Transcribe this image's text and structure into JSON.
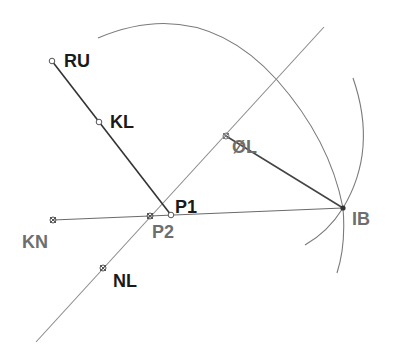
{
  "diagram": {
    "title": "",
    "colors": {
      "background": "#ffffff",
      "dark_line": "#333333",
      "light_line": "#8a8a8a",
      "arc": "#7a7a7a",
      "label_dark": "#1a1a1a",
      "label_gray": "#6e6e6e"
    },
    "points": [
      {
        "id": "RU",
        "label": "RU",
        "x": 52,
        "y": 61,
        "marker": "open-circle",
        "label_color": "label_dark"
      },
      {
        "id": "KL",
        "label": "KL",
        "x": 99,
        "y": 122,
        "marker": "open-circle",
        "label_color": "label_dark"
      },
      {
        "id": "P1",
        "label": "P1",
        "x": 171,
        "y": 215,
        "marker": "open-circle",
        "label_color": "label_dark"
      },
      {
        "id": "P2",
        "label": "P2",
        "x": 150,
        "y": 216,
        "marker": "cross",
        "label_color": "label_gray"
      },
      {
        "id": "KN",
        "label": "KN",
        "x": 53,
        "y": 220,
        "marker": "cross",
        "label_color": "label_gray"
      },
      {
        "id": "NL",
        "label": "NL",
        "x": 103,
        "y": 268,
        "marker": "cross",
        "label_color": "label_dark"
      },
      {
        "id": "OL",
        "label": "ØL",
        "x": 226,
        "y": 136,
        "marker": "cross",
        "label_color": "label_gray"
      },
      {
        "id": "IB",
        "label": "IB",
        "x": 343,
        "y": 208,
        "marker": "filled",
        "label_color": "label_gray"
      }
    ],
    "lines": [
      {
        "id": "RU-P1",
        "from": "RU",
        "to": "P1",
        "style": "dark"
      },
      {
        "id": "KN-IB",
        "from": "KN",
        "to": "IB",
        "style": "light"
      },
      {
        "id": "OL-IB",
        "from": "OL",
        "to": "IB",
        "style": "dark"
      },
      {
        "id": "diagonal",
        "x1": 36,
        "y1": 342,
        "x2": 324,
        "y2": 27,
        "style": "light",
        "passes_through": [
          "NL",
          "P2",
          "OL"
        ]
      }
    ],
    "arcs": [
      {
        "id": "large-arc",
        "description": "arc through top to IB",
        "start": [
          98,
          38
        ],
        "end": [
          337,
          273
        ]
      },
      {
        "id": "small-arc",
        "description": "arc right of IB",
        "start": [
          353,
          78
        ],
        "end": [
          305,
          245
        ]
      }
    ]
  }
}
